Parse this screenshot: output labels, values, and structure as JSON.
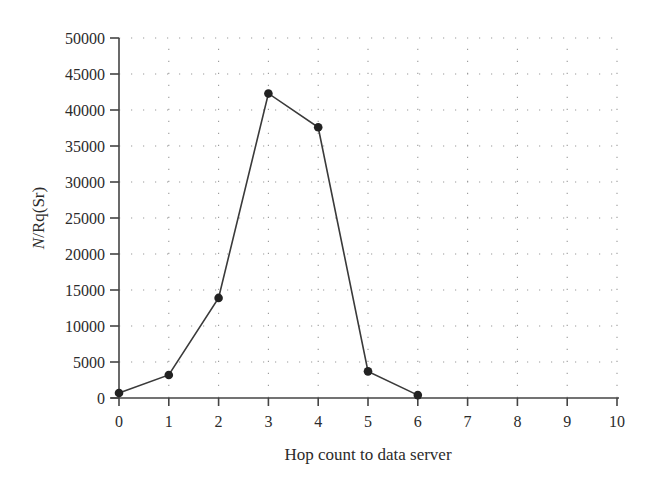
{
  "chart_data": {
    "type": "line",
    "title": "",
    "xlabel": "Hop count to data server",
    "ylabel_italic": "N",
    "ylabel_rest": "/Rq(Sr)",
    "ylabel": "N/Rq(Sr)",
    "x": [
      0,
      1,
      2,
      3,
      4,
      5,
      6
    ],
    "series": [
      {
        "name": "N/Rq(Sr)",
        "values": [
          700,
          3200,
          13900,
          42300,
          37600,
          3700,
          400
        ],
        "color": "#222222",
        "marker": "circle"
      }
    ],
    "xlim": [
      0,
      10
    ],
    "ylim": [
      0,
      50000
    ],
    "xticks": [
      0,
      1,
      2,
      3,
      4,
      5,
      6,
      7,
      8,
      9,
      10
    ],
    "yticks": [
      0,
      5000,
      10000,
      15000,
      20000,
      25000,
      30000,
      35000,
      40000,
      45000,
      50000
    ],
    "grid": "dotted",
    "legend": "none"
  }
}
